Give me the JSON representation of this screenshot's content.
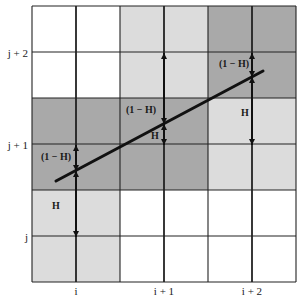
{
  "diagram": {
    "title": "",
    "grid": {
      "left": 32,
      "top": 6,
      "cell_w": 44,
      "cell_h": 46,
      "cols": 6,
      "rows": 6,
      "shading": [
        [
          "white",
          "white",
          "light",
          "light",
          "dark",
          "dark"
        ],
        [
          "white",
          "white",
          "light",
          "light",
          "dark",
          "dark"
        ],
        [
          "dark",
          "dark",
          "dark",
          "dark",
          "light",
          "light"
        ],
        [
          "dark",
          "dark",
          "dark",
          "dark",
          "light",
          "light"
        ],
        [
          "light",
          "light",
          "white",
          "white",
          "white",
          "white"
        ],
        [
          "light",
          "light",
          "white",
          "white",
          "white",
          "white"
        ]
      ],
      "colors": {
        "white": "#ffffff",
        "light": "#dcdcdc",
        "dark": "#a9a9a9",
        "line": "#222222"
      }
    },
    "x_labels": [
      {
        "text": "i",
        "x": 76
      },
      {
        "text": "i + 1",
        "x": 164
      },
      {
        "text": "i + 2",
        "x": 252
      }
    ],
    "y_labels": [
      {
        "text": "j + 2",
        "y": 53
      },
      {
        "text": "j + 1",
        "y": 145
      },
      {
        "text": "j",
        "y": 237
      }
    ],
    "fit_line": {
      "x1": 56,
      "y1": 181,
      "x2": 263,
      "y2": 71
    },
    "columns": [
      {
        "name": "i",
        "x": 76,
        "top": 145,
        "mid": 171,
        "bottom": 237,
        "upper_label": "(1 − H)",
        "upper_label_x": 56,
        "upper_label_y": 160,
        "lower_label": "H",
        "lower_label_x": 56,
        "lower_label_y": 209
      },
      {
        "name": "i+1",
        "x": 164,
        "top": 53,
        "mid": 124,
        "bottom": 145,
        "upper_label": "(1 − H)",
        "upper_label_x": 141,
        "upper_label_y": 113,
        "lower_label": "H",
        "lower_label_x": 155,
        "lower_label_y": 139
      },
      {
        "name": "i+2",
        "x": 252,
        "top": 53,
        "mid": 77,
        "bottom": 145,
        "upper_label": "(1 − H)",
        "upper_label_x": 234,
        "upper_label_y": 67,
        "lower_label": "H",
        "lower_label_x": 245,
        "lower_label_y": 116
      }
    ]
  }
}
